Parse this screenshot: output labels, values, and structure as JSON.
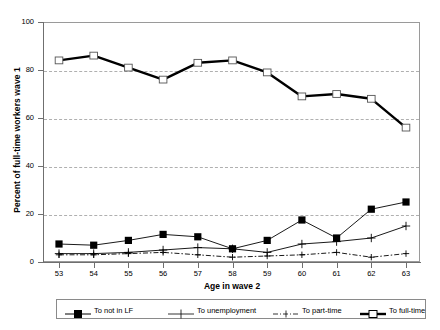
{
  "chart_data": {
    "type": "line",
    "title": "",
    "xlabel": "Age in wave 2",
    "ylabel": "Percent of full-time workers wave 1",
    "x": [
      53,
      54,
      55,
      56,
      57,
      58,
      59,
      60,
      61,
      62,
      63
    ],
    "categories": [
      "53",
      "54",
      "55",
      "56",
      "57",
      "58",
      "59",
      "60",
      "61",
      "62",
      "63"
    ],
    "xlim": [
      52.5,
      63.5
    ],
    "ylim": [
      0,
      100
    ],
    "yticks": [
      0,
      20,
      40,
      60,
      80,
      100
    ],
    "ytick_labels": [
      "0",
      "20",
      "40",
      "60",
      "80",
      "100"
    ],
    "grid": "horizontal-dashed",
    "legend_position": "bottom",
    "series": [
      {
        "name": "To not in LF",
        "marker": "filled-square",
        "line": "solid-thin",
        "values": [
          7.5,
          7,
          9,
          11.5,
          10.5,
          5.5,
          9,
          17.5,
          10,
          22,
          25
        ]
      },
      {
        "name": "To unemployment",
        "marker": "plus",
        "line": "solid-thin",
        "values": [
          3.5,
          3.5,
          4,
          5,
          6,
          5.5,
          4,
          7.5,
          8.5,
          10,
          15
        ]
      },
      {
        "name": "To part-time",
        "marker": "plus-small",
        "line": "dash-dot",
        "values": [
          3,
          3,
          3.5,
          4,
          3,
          2,
          2.5,
          3,
          4,
          2,
          3.5
        ]
      },
      {
        "name": "To full-time",
        "marker": "open-square",
        "line": "solid-thick",
        "values": [
          84,
          86,
          81,
          76,
          83,
          84,
          79,
          69,
          70,
          68,
          56
        ]
      }
    ]
  },
  "colors": {
    "axis": "#6f6f6f",
    "grid": "#b0b0b0",
    "series": "#000000",
    "background": "#ffffff"
  }
}
